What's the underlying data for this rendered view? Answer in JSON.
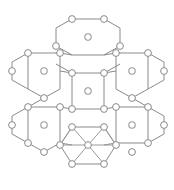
{
  "figure": {
    "type": "diagram",
    "background_color": "#ffffff",
    "line_color": "#8a8a8a",
    "diagonal_line_color": "#9a9a9a",
    "node_fill_color": "#ffffff",
    "node_stroke_color": "#8a8a8a",
    "center_dot_color": "#9a9a9a",
    "vertex_radius": 3.4,
    "center_dot_outer_radius": 3.2,
    "center_dot_inner_radius": 1.6,
    "stroke_width": 1,
    "canvas": {
      "width": 174,
      "height": 190
    }
  },
  "lattice": {
    "hex_half_width": 16,
    "hex_quarter_height": 9,
    "hex_half_height": 18,
    "hexagons": [
      {
        "id": "hex-top",
        "name": "top-hexagon",
        "cx": 88,
        "cy": 37,
        "center_marker": "isolated-dot",
        "triangulated": false
      },
      {
        "id": "hex-upper-left",
        "name": "upper-left-hexagon",
        "cx": 44,
        "cy": 71,
        "center_marker": "isolated-dot",
        "triangulated": false
      },
      {
        "id": "hex-upper-right",
        "name": "upper-right-hexagon",
        "cx": 132,
        "cy": 71,
        "center_marker": "isolated-dot",
        "triangulated": false
      },
      {
        "id": "hex-middle",
        "name": "middle-hexagon",
        "cx": 88,
        "cy": 91,
        "center_marker": "isolated-dot",
        "triangulated": false
      },
      {
        "id": "hex-lower-left",
        "name": "lower-left-hexagon",
        "cx": 44,
        "cy": 125,
        "center_marker": "isolated-dot",
        "triangulated": false
      },
      {
        "id": "hex-lower-right",
        "name": "lower-right-hexagon",
        "cx": 132,
        "cy": 125,
        "center_marker": "isolated-dot",
        "triangulated": false
      },
      {
        "id": "hex-bottom",
        "name": "bottom-triangulated-hexagon",
        "cx": 88,
        "cy": 146,
        "center_marker": "connected-node",
        "triangulated": true
      }
    ],
    "bottom_hexagon_note": "center node connected to all six vertices forming six triangles",
    "total_hexagons": 7,
    "total_vertex_nodes": 30,
    "total_isolated_center_dots": 6
  }
}
